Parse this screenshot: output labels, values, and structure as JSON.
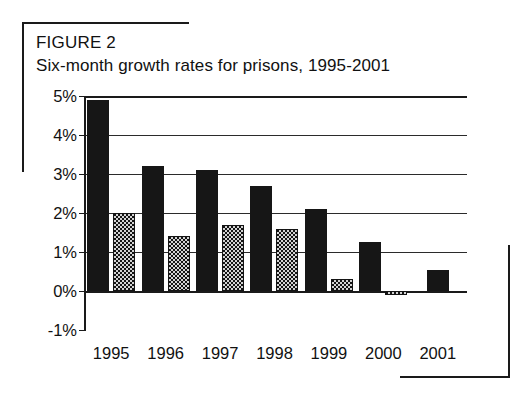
{
  "figure": {
    "label": "FIGURE 2",
    "title": "Six-month growth rates for prisons, 1995-2001"
  },
  "chart_data": {
    "type": "bar",
    "title": "Six-month growth rates for prisons, 1995-2001",
    "xlabel": "",
    "ylabel": "",
    "categories": [
      "1995",
      "1996",
      "1997",
      "1998",
      "1999",
      "2000",
      "2001"
    ],
    "series": [
      {
        "name": "first-half",
        "style": "solid-black",
        "values": [
          4.9,
          3.2,
          3.1,
          2.7,
          2.1,
          1.25,
          0.55
        ]
      },
      {
        "name": "second-half",
        "style": "dotted-pattern",
        "values": [
          2.0,
          1.4,
          1.7,
          1.6,
          0.3,
          -0.1,
          null
        ]
      }
    ],
    "ytick_labels": [
      "5%",
      "4%",
      "3%",
      "2%",
      "1%",
      "0%",
      "-1%"
    ],
    "ytick_values": [
      5,
      4,
      3,
      2,
      1,
      0,
      -1
    ],
    "ylim": [
      -1,
      5
    ],
    "grid": true,
    "legend": "none",
    "colors": {
      "series_solid": "#161616",
      "series_dotted": "#141414",
      "axis": "#1a1a1a",
      "background": "#ffffff"
    }
  }
}
